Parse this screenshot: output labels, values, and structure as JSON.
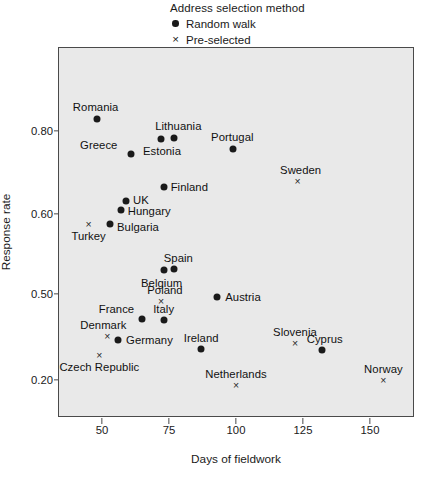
{
  "legend": {
    "title": "Address selection method",
    "entries": [
      {
        "label": "Random walk",
        "marker": "filled-circle",
        "symbol": "●"
      },
      {
        "label": "Pre-selected",
        "marker": "cross",
        "symbol": "×"
      }
    ]
  },
  "chart_data": {
    "type": "scatter",
    "title": "",
    "xlabel": "Days of fieldwork",
    "ylabel": "Response rate",
    "xticks": [
      50,
      75,
      100,
      125,
      150
    ],
    "xticklabels": [
      "50",
      "75",
      "100",
      "125",
      "150"
    ],
    "yticks": [
      0.8,
      0.6,
      0.5,
      0.2
    ],
    "yticklabels": [
      "0.80",
      "0.60",
      "0.50",
      "0.20"
    ],
    "xlim": [
      34,
      167
    ],
    "grid": false,
    "legend_position": "above-plot",
    "note": "y-axis uses non-uniform tick spacing",
    "series": [
      {
        "name": "Random walk",
        "marker": "filled-circle",
        "points": [
          {
            "label": "Romania",
            "x": 48,
            "y": 0.83,
            "label_dx": -1,
            "label_dy": -12,
            "label_anchor": "middle"
          },
          {
            "label": "Greece",
            "x": 61,
            "y": 0.745,
            "label_dx": -14,
            "label_dy": -9,
            "label_anchor": "end"
          },
          {
            "label": "Estonia",
            "x": 72,
            "y": 0.78,
            "label_dx": 1,
            "label_dy": 12,
            "label_anchor": "middle"
          },
          {
            "label": "Lithuania",
            "x": 77,
            "y": 0.782,
            "label_dx": 4,
            "label_dy": -12,
            "label_anchor": "middle"
          },
          {
            "label": "Portugal",
            "x": 99,
            "y": 0.757,
            "label_dx": -1,
            "label_dy": -12,
            "label_anchor": "middle"
          },
          {
            "label": "Finland",
            "x": 73,
            "y": 0.665,
            "label_dx": 7,
            "label_dy": 0,
            "label_anchor": "start"
          },
          {
            "label": "UK",
            "x": 59,
            "y": 0.632,
            "label_dx": 7,
            "label_dy": -1,
            "label_anchor": "start"
          },
          {
            "label": "Hungary",
            "x": 57,
            "y": 0.61,
            "label_dx": 7,
            "label_dy": 1,
            "label_anchor": "start"
          },
          {
            "label": "Bulgaria",
            "x": 53,
            "y": 0.588,
            "label_dx": 7,
            "label_dy": 3,
            "label_anchor": "start"
          },
          {
            "label": "Belgium",
            "x": 73,
            "y": 0.53,
            "label_dx": -2,
            "label_dy": 13,
            "label_anchor": "middle"
          },
          {
            "label": "Spain",
            "x": 77,
            "y": 0.531,
            "label_dx": 4,
            "label_dy": -11,
            "label_anchor": "middle"
          },
          {
            "label": "Austria",
            "x": 93,
            "y": 0.49,
            "label_dx": 8,
            "label_dy": 0,
            "label_anchor": "start"
          },
          {
            "label": "France",
            "x": 65,
            "y": 0.412,
            "label_dx": -8,
            "label_dy": -10,
            "label_anchor": "end"
          },
          {
            "label": "Italy",
            "x": 73,
            "y": 0.41,
            "label_dx": 0,
            "label_dy": -11,
            "label_anchor": "middle"
          },
          {
            "label": "Germany",
            "x": 56,
            "y": 0.338,
            "label_dx": 8,
            "label_dy": 0,
            "label_anchor": "start"
          },
          {
            "label": "Ireland",
            "x": 87,
            "y": 0.307,
            "label_dx": 0,
            "label_dy": -11,
            "label_anchor": "middle"
          },
          {
            "label": "Cyprus",
            "x": 132,
            "y": 0.305,
            "label_dx": 3,
            "label_dy": -11,
            "label_anchor": "middle"
          }
        ]
      },
      {
        "name": "Pre-selected",
        "marker": "cross",
        "points": [
          {
            "label": "Turkey",
            "x": 45,
            "y": 0.588,
            "label_dx": 0,
            "label_dy": 12,
            "label_anchor": "middle"
          },
          {
            "label": "Sweden",
            "x": 123,
            "y": 0.68,
            "label_dx": 3,
            "label_dy": -11,
            "label_anchor": "middle"
          },
          {
            "label": "Poland",
            "x": 72,
            "y": 0.477,
            "label_dx": 4,
            "label_dy": -11,
            "label_anchor": "middle"
          },
          {
            "label": "Denmark",
            "x": 52,
            "y": 0.353,
            "label_dx": -4,
            "label_dy": -11,
            "label_anchor": "middle"
          },
          {
            "label": "Czech Republic",
            "x": 49,
            "y": 0.288,
            "label_dx": 0,
            "label_dy": 12,
            "label_anchor": "middle"
          },
          {
            "label": "Slovenia",
            "x": 122,
            "y": 0.33,
            "label_dx": 0,
            "label_dy": -11,
            "label_anchor": "middle"
          },
          {
            "label": "Netherlands",
            "x": 100,
            "y": 0.183,
            "label_dx": 0,
            "label_dy": -11,
            "label_anchor": "middle"
          },
          {
            "label": "Norway",
            "x": 155,
            "y": 0.2,
            "label_dx": 0,
            "label_dy": -11,
            "label_anchor": "middle"
          }
        ]
      }
    ]
  }
}
